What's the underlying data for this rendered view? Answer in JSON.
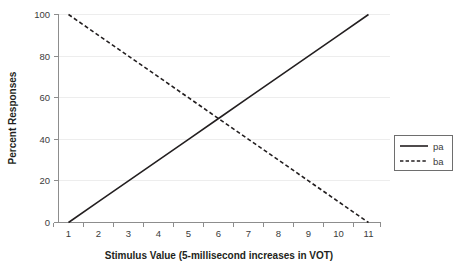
{
  "chart_data": {
    "type": "line",
    "title": "",
    "xlabel": "Stimulus Value (5-millisecond increases in VOT)",
    "ylabel": "Percent Responses",
    "x": [
      1,
      2,
      3,
      4,
      5,
      6,
      7,
      8,
      9,
      10,
      11
    ],
    "xtick_labels": [
      "1",
      "2",
      "3",
      "4",
      "5",
      "6",
      "7",
      "8",
      "9",
      "10",
      "11"
    ],
    "ytick_labels": [
      "0",
      "20",
      "40",
      "60",
      "80",
      "100"
    ],
    "yticks": [
      0,
      20,
      40,
      60,
      80,
      100
    ],
    "xlim": [
      0.5,
      11.5
    ],
    "ylim": [
      0,
      100
    ],
    "grid": "horizontal",
    "legend_position": "right",
    "series": [
      {
        "name": "pa",
        "style": "solid",
        "color": "#231f20",
        "values": [
          0,
          10,
          20,
          30,
          40,
          50,
          60,
          70,
          80,
          90,
          100
        ]
      },
      {
        "name": "ba",
        "style": "dashed",
        "color": "#231f20",
        "values": [
          100,
          90,
          80,
          70,
          60,
          50,
          40,
          30,
          20,
          10,
          0
        ]
      }
    ],
    "annotations": {
      "crossover_point": "6, 50"
    }
  },
  "legend": {
    "entries": [
      {
        "label": "pa",
        "style": "solid"
      },
      {
        "label": "ba",
        "style": "dashed"
      }
    ]
  },
  "colors": {
    "background": "#ffffff",
    "line": "#231f20",
    "grid": "#ededed",
    "axis": "#8d8d8d",
    "text": "#231f20"
  }
}
